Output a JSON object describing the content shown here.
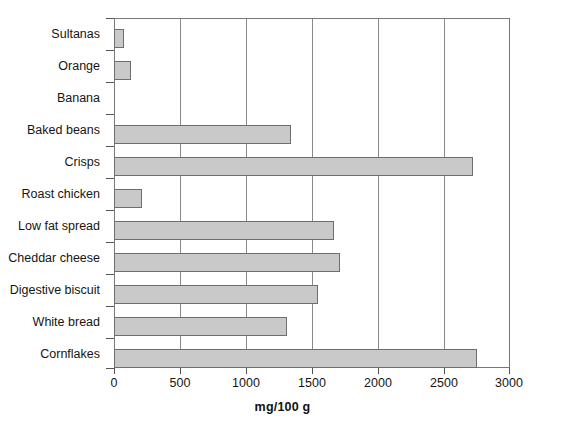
{
  "chart_data": {
    "type": "bar",
    "orientation": "horizontal",
    "title": "",
    "xlabel": "mg/100 g",
    "ylabel": "",
    "xlim": [
      0,
      3000
    ],
    "xticks": [
      0,
      500,
      1000,
      1500,
      2000,
      2500,
      3000
    ],
    "xtick_labels": [
      "0",
      "500",
      "1000",
      "1500",
      "2000",
      "2500",
      "3000"
    ],
    "grid": true,
    "grid_axis": "x",
    "legend": null,
    "bar_fill_color": "#c9c9c9",
    "bar_border_color": "#6e6e6e",
    "categories": [
      "Sultanas",
      "Orange",
      "Banana",
      "Baked beans",
      "Crisps",
      "Roast chicken",
      "Low fat spread",
      "Cheddar cheese",
      "Digestive biscuit",
      "White bread",
      "Cornflakes"
    ],
    "values": [
      75,
      130,
      0,
      1340,
      2720,
      210,
      1670,
      1710,
      1545,
      1310,
      2750
    ]
  }
}
